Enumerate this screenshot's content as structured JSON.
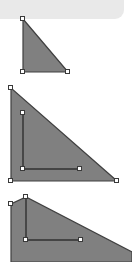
{
  "app": {
    "canvas_width": 132,
    "canvas_height": 262,
    "background_color": "#ffffff",
    "band_color": "#e9e9e9",
    "shape_fill_color": "#808080",
    "shape_stroke_color": "#404040",
    "handle_fill_color": "#ffffff",
    "handle_border_color": "#3a3a3a"
  },
  "top_band": {
    "name": "toolbar-strip",
    "label": "",
    "x": 0,
    "y": 0,
    "width": 124,
    "height": 19
  },
  "shapes": [
    {
      "id": "shape-1",
      "name": "right-triangle-small",
      "label": "",
      "fill": "#808080",
      "stroke": "#404040",
      "points": "23,19 23,72 68,72",
      "handles": [
        {
          "name": "vertex-handle-top",
          "x": 23,
          "y": 19
        },
        {
          "name": "vertex-handle-bottom-left",
          "x": 23,
          "y": 72
        },
        {
          "name": "vertex-handle-bottom-right",
          "x": 68,
          "y": 72
        }
      ]
    },
    {
      "id": "shape-2",
      "name": "right-triangle-large-with-inner",
      "label": "",
      "fill": "#808080",
      "stroke": "#404040",
      "points": "11,88 11,181 117,181",
      "handles": [
        {
          "name": "vertex-handle-top",
          "x": 11,
          "y": 88
        },
        {
          "name": "vertex-handle-bottom-left",
          "x": 11,
          "y": 181
        },
        {
          "name": "vertex-handle-bottom-right",
          "x": 117,
          "y": 181
        }
      ],
      "inner": {
        "name": "inner-triangle-outline",
        "points": "23,113 23,169 80,169",
        "stroke": "#303030",
        "handles": [
          {
            "name": "inner-vertex-handle-top",
            "x": 23,
            "y": 113
          },
          {
            "name": "inner-vertex-handle-bottom-left",
            "x": 23,
            "y": 169
          },
          {
            "name": "inner-vertex-handle-bottom-right",
            "x": 80,
            "y": 169
          }
        ]
      }
    },
    {
      "id": "shape-3",
      "name": "right-triangle-editing",
      "label": "",
      "fill": "#808080",
      "stroke": "#404040",
      "points": "11,204 11,262 132,262 132,252 26,197",
      "handles": [
        {
          "name": "vertex-handle-left",
          "x": 11,
          "y": 204
        },
        {
          "name": "vertex-handle-apex",
          "x": 26,
          "y": 197
        },
        {
          "name": "inner-vertex-handle-bottom-left",
          "x": 26,
          "y": 240
        },
        {
          "name": "inner-vertex-handle-bottom-right",
          "x": 81,
          "y": 240
        }
      ],
      "inner": {
        "name": "inner-edit-outline",
        "points": "26,197 26,240 81,240",
        "stroke": "#303030"
      }
    }
  ]
}
